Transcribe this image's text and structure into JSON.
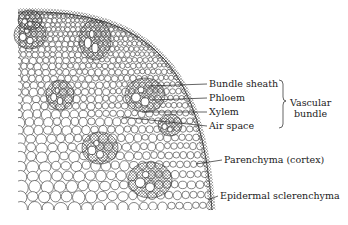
{
  "figure": {
    "labels": [
      {
        "id": "bundle-sheath",
        "text": "Bundle sheath",
        "x": 209,
        "y": 84,
        "line_from": [
          148,
          86
        ]
      },
      {
        "id": "phloem",
        "text": "Phloem",
        "x": 209,
        "y": 98,
        "line_from": [
          152,
          100
        ]
      },
      {
        "id": "xylem",
        "text": "Xylem",
        "x": 209,
        "y": 112,
        "line_from": [
          142,
          112
        ]
      },
      {
        "id": "air-space",
        "text": "Air space",
        "x": 209,
        "y": 126,
        "line_from": [
          122,
          117
        ]
      },
      {
        "id": "parenchyma",
        "text": "Parenchyma (cortex)",
        "x": 224,
        "y": 160,
        "line_from": [
          196,
          164
        ]
      },
      {
        "id": "epidermal-sclerenchyma",
        "text": "Epidermal sclerenchyma",
        "x": 220,
        "y": 196,
        "line_from": [
          208,
          200
        ]
      }
    ],
    "bracket": {
      "text_line1": "Vascular",
      "text_line2": "bundle",
      "x": 290,
      "y": 97
    },
    "colors": {
      "ink": "#222222",
      "background": "#ffffff",
      "stipple": "#555555"
    }
  }
}
